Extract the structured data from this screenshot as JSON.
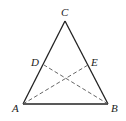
{
  "diagram": {
    "type": "isosceles triangle with dashed cevians",
    "points": {
      "A": {
        "label": "A",
        "x": 23,
        "y": 104
      },
      "B": {
        "label": "B",
        "x": 108,
        "y": 104
      },
      "C": {
        "label": "C",
        "x": 65,
        "y": 21
      },
      "D": {
        "label": "D",
        "x": 44,
        "y": 65
      },
      "E": {
        "label": "E",
        "x": 88,
        "y": 65
      }
    },
    "solid_segments": [
      "AC",
      "BC",
      "AB"
    ],
    "dashed_segments": [
      "AE",
      "BD"
    ],
    "colors": {
      "stroke": "#222222",
      "dashed": "#555555",
      "background": "#ffffff"
    }
  }
}
